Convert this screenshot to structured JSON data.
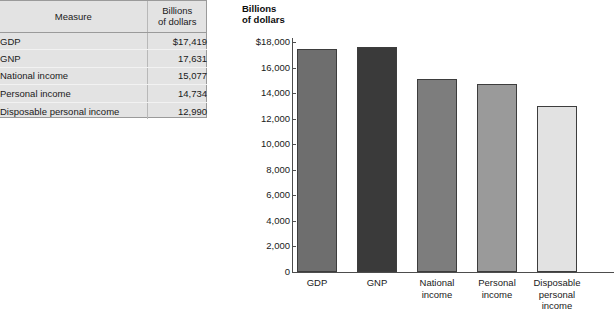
{
  "table": {
    "headers": {
      "measure": "Measure",
      "value_line1": "Billions",
      "value_line2": "of dollars"
    },
    "rows": [
      {
        "measure": "GDP",
        "value": "$17,419"
      },
      {
        "measure": "GNP",
        "value": "17,631"
      },
      {
        "measure": "National income",
        "value": "15,077"
      },
      {
        "measure": "Personal income",
        "value": "14,734"
      },
      {
        "measure": "Disposable personal income",
        "value": "12,990"
      }
    ]
  },
  "chart": {
    "axis_title_line1": "Billions",
    "axis_title_line2": "of dollars",
    "tick_labels": [
      "$18,000",
      "16,000",
      "14,000",
      "12,000",
      "10,000",
      "8,000",
      "6,000",
      "4,000",
      "2,000",
      "0"
    ],
    "bar_labels": [
      [
        "GDP"
      ],
      [
        "GNP"
      ],
      [
        "National",
        "income"
      ],
      [
        "Personal",
        "income"
      ],
      [
        "Disposable",
        "personal",
        "income"
      ]
    ]
  },
  "chart_data": {
    "type": "bar",
    "title": "",
    "xlabel": "",
    "ylabel": "Billions of dollars",
    "categories": [
      "GDP",
      "GNP",
      "National income",
      "Personal income",
      "Disposable personal income"
    ],
    "values": [
      17419,
      17631,
      15077,
      14734,
      12990
    ],
    "ylim": [
      0,
      18000
    ],
    "ytick_values": [
      0,
      2000,
      4000,
      6000,
      8000,
      10000,
      12000,
      14000,
      16000,
      18000
    ],
    "grid": false,
    "legend": "none",
    "bar_colors": [
      "#6e6e6e",
      "#3a3a3a",
      "#7d7d7d",
      "#9a9a9a",
      "#e2e2e2"
    ],
    "bar_border_color": "#3d3d3d"
  }
}
